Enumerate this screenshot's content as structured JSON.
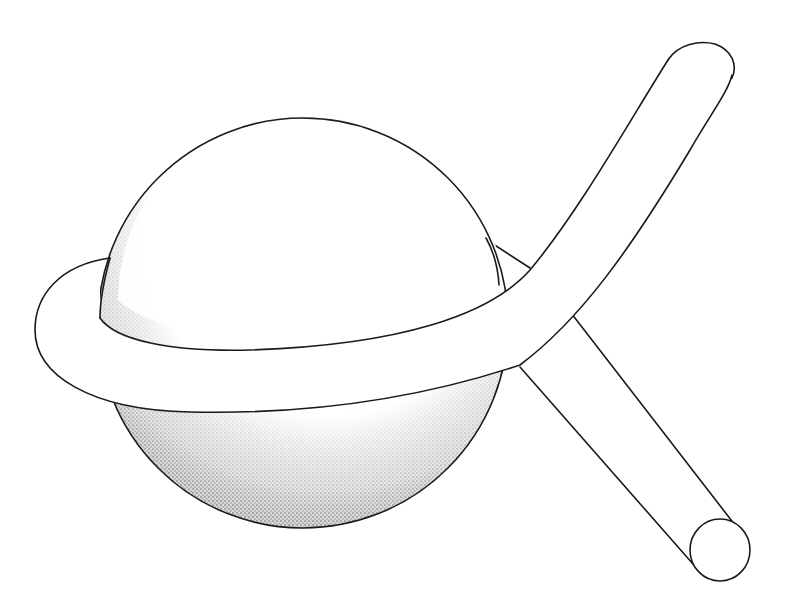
{
  "figure": {
    "colors": {
      "ink": "#1a1a1a",
      "paper": "#ffffff"
    },
    "elements": [
      {
        "name": "sphere",
        "shading": "stipple",
        "center": [
          303,
          323
        ],
        "radius": 205
      },
      {
        "name": "tube-loop",
        "note": "wraps around sphere equator"
      },
      {
        "name": "tube-upper-end",
        "shape": "rounded cap",
        "approx_position": [
          700,
          70
        ]
      },
      {
        "name": "tube-lower-end",
        "shape": "open circular end",
        "center": [
          720,
          550
        ],
        "radius": 30
      }
    ]
  }
}
